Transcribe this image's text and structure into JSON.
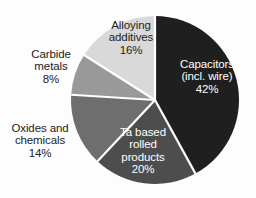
{
  "chart_data": {
    "type": "pie",
    "title": "",
    "subtitle": "",
    "legend_position": "none",
    "grid": false,
    "units": "percent",
    "total": 100,
    "start_angle_deg": 0,
    "direction": "clockwise",
    "categories": [
      "Capacitors (incl. wire)",
      "Ta based rolled products",
      "Oxides and chemicals",
      "Carbide metals",
      "Alloying additives"
    ],
    "values": [
      42,
      20,
      14,
      8,
      16
    ],
    "colors": [
      "#1f1f1f",
      "#4d4d4d",
      "#6e6e6e",
      "#999999",
      "#d9d9d9"
    ],
    "separator_color": "#ffffff",
    "background_color": "#fdfdfd",
    "slices": [
      {
        "name": "capacitors",
        "lines": [
          "Capacitors",
          "(incl. wire)"
        ],
        "value_label": "42%",
        "value": 42,
        "color": "#1f1f1f",
        "label_placement": "inside",
        "label_color": "#ffffff"
      },
      {
        "name": "ta-based-rolled-products",
        "lines": [
          "Ta based",
          "rolled",
          "products"
        ],
        "value_label": "20%",
        "value": 20,
        "color": "#4d4d4d",
        "label_placement": "inside",
        "label_color": "#ffffff"
      },
      {
        "name": "oxides-and-chemicals",
        "lines": [
          "Oxides and",
          "chemicals"
        ],
        "value_label": "14%",
        "value": 14,
        "color": "#6e6e6e",
        "label_placement": "outside",
        "label_color": "#232323"
      },
      {
        "name": "carbide-metals",
        "lines": [
          "Carbide",
          "metals"
        ],
        "value_label": "8%",
        "value": 8,
        "color": "#999999",
        "label_placement": "outside",
        "label_color": "#232323"
      },
      {
        "name": "alloying-additives",
        "lines": [
          "Alloying",
          "additives"
        ],
        "value_label": "16%",
        "value": 16,
        "color": "#d9d9d9",
        "label_placement": "inside",
        "label_color": "#232323"
      }
    ]
  },
  "labels": {
    "capacitors": {
      "line1": "Capacitors",
      "line2": "(incl. wire)",
      "line3": "42%"
    },
    "ta_rolled": {
      "line1": "Ta based",
      "line2": "rolled",
      "line3": "products",
      "line4": "20%"
    },
    "oxides": {
      "line1": "Oxides and",
      "line2": "chemicals",
      "line3": "14%"
    },
    "carbide": {
      "line1": "Carbide",
      "line2": "metals",
      "line3": "8%"
    },
    "alloying": {
      "line1": "Alloying",
      "line2": "additives",
      "line3": "16%"
    }
  }
}
